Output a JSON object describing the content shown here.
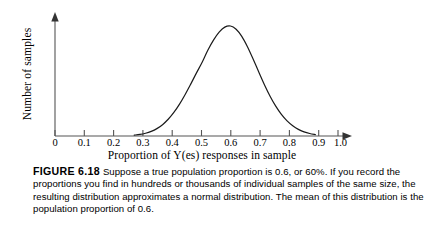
{
  "figure": {
    "label": "FIGURE 6.18",
    "caption": "Suppose a true population proportion is 0.6, or 60%. If you record the proportions you find in hundreds or thousands of individual samples of the same size, the resulting distribution approximates a normal distribution. The mean of this distribution is the population proportion of 0.6.",
    "caption_lines": [
      "Suppose a true population proportion is 0.6, or 60%. If you record the",
      "proportions you find in hundreds or thousands of individual samples",
      "of the same size, the resulting distribution approximates a normal",
      "distribution. The mean of this distribution is the population proportion",
      "of 0.6."
    ]
  },
  "chart_data": {
    "type": "line",
    "title": "",
    "xlabel": "Proportion of Y(es) responses in sample",
    "ylabel": "Number of samples",
    "xlim": [
      0,
      1.0
    ],
    "ylim": [
      0,
      1.12
    ],
    "grid": false,
    "legend": "none",
    "axis_arrows": true,
    "x_tick_labels": [
      "0",
      "0.1",
      "0.2",
      "0.3",
      "0.4",
      "0.5",
      "0.6",
      "0.7",
      "0.8",
      "0.9",
      "1.0"
    ],
    "x_tick_values": [
      0,
      0.1,
      0.2,
      0.3,
      0.4,
      0.5,
      0.6,
      0.7,
      0.8,
      0.9,
      1.0
    ],
    "y_tick_labels": [],
    "curve": {
      "name": "sampling distribution of sample proportion",
      "distribution": "normal",
      "mean": 0.6,
      "std_dev": 0.105,
      "peak_x": 0.6,
      "peak_y": 1.0,
      "visible_x_range": [
        0.28,
        0.92
      ],
      "color": "#1a1a1a",
      "line_width": 1.2,
      "x": [
        0.28,
        0.3,
        0.32,
        0.34,
        0.36,
        0.38,
        0.4,
        0.42,
        0.44,
        0.46,
        0.48,
        0.5,
        0.52,
        0.54,
        0.56,
        0.58,
        0.6,
        0.62,
        0.64,
        0.66,
        0.68,
        0.7,
        0.72,
        0.74,
        0.76,
        0.78,
        0.8,
        0.82,
        0.84,
        0.86,
        0.88,
        0.9,
        0.92
      ],
      "y": [
        0.008,
        0.014,
        0.025,
        0.042,
        0.067,
        0.103,
        0.152,
        0.214,
        0.29,
        0.378,
        0.474,
        0.574,
        0.67,
        0.779,
        0.871,
        0.944,
        0.99,
        1.0,
        0.971,
        0.906,
        0.812,
        0.7,
        0.582,
        0.467,
        0.362,
        0.271,
        0.196,
        0.137,
        0.093,
        0.06,
        0.038,
        0.023,
        0.013
      ]
    },
    "axis_color": "#555555"
  }
}
